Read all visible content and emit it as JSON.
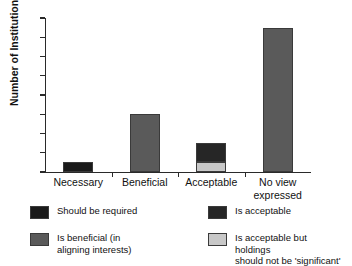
{
  "chart_data": {
    "type": "bar",
    "title": "",
    "xlabel": "",
    "ylabel": "Number of Institutions",
    "ylim": [
      0,
      16
    ],
    "yticks": [
      0,
      2,
      4,
      6,
      8,
      10,
      12,
      14,
      16
    ],
    "grid": false,
    "stacked": true,
    "legend_position": "bottom",
    "categories": [
      "Necessary",
      "Beneficial",
      "Acceptable",
      "No view expressed"
    ],
    "category_label_lines": [
      [
        "Necessary"
      ],
      [
        "Beneficial"
      ],
      [
        "Acceptable"
      ],
      [
        "No view",
        "expressed"
      ]
    ],
    "series": [
      {
        "name": "Should be required",
        "color": "#1a1a1a",
        "values": [
          1,
          0,
          0,
          0
        ]
      },
      {
        "name": "Is beneficial (in aligning interests)",
        "color": "#5a5a5a",
        "values": [
          0,
          6,
          0,
          15
        ]
      },
      {
        "name": "Is acceptable but holdings should not be 'significant'",
        "color": "#c8c8c8",
        "values": [
          0,
          0,
          1,
          0
        ]
      },
      {
        "name": "Is acceptable",
        "color": "#262626",
        "values": [
          0,
          0,
          2,
          0
        ]
      }
    ],
    "bar_totals": [
      1,
      6,
      3,
      15
    ],
    "legend": [
      {
        "label": "Should be required",
        "color": "#1a1a1a"
      },
      {
        "label": "Is acceptable",
        "color": "#262626"
      },
      {
        "label": "Is beneficial (in\naligning interests)",
        "color": "#5a5a5a"
      },
      {
        "label": "Is acceptable but holdings\nshould not be 'significant'",
        "color": "#c8c8c8"
      }
    ]
  },
  "axis": {
    "y_tick_labels": [
      "0",
      "2",
      "4",
      "6",
      "8",
      "10",
      "12",
      "14",
      "16"
    ],
    "y_title": "Number of Institutions"
  }
}
